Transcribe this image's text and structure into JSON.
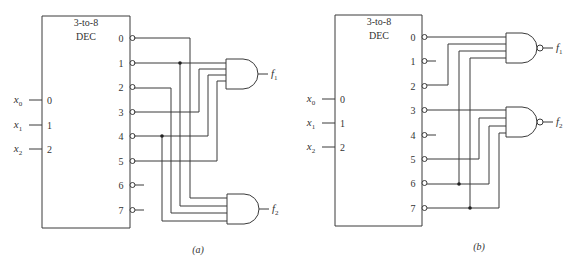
{
  "figures": [
    {
      "id": "a",
      "caption": "(a)",
      "decoder": {
        "title_line1": "3-to-8",
        "title_line2": "DEC",
        "inputs": [
          {
            "var": "x",
            "sub": "0",
            "pin": "0"
          },
          {
            "var": "x",
            "sub": "1",
            "pin": "1"
          },
          {
            "var": "x",
            "sub": "2",
            "pin": "2"
          }
        ],
        "outputs": [
          "0",
          "1",
          "2",
          "3",
          "4",
          "5",
          "6",
          "7"
        ],
        "output_polarity": "active-low"
      },
      "gates": [
        {
          "type": "AND",
          "output_var": "f",
          "output_sub": "1",
          "inputs_from_outputs": [
            1,
            3,
            4,
            5
          ]
        },
        {
          "type": "AND",
          "output_var": "f",
          "output_sub": "2",
          "inputs_from_outputs": [
            0,
            1,
            2,
            4
          ]
        }
      ],
      "junctions_on_outputs": [
        1,
        4
      ],
      "unused_outputs": [
        6,
        7
      ]
    },
    {
      "id": "b",
      "caption": "(b)",
      "decoder": {
        "title_line1": "3-to-8",
        "title_line2": "DEC",
        "inputs": [
          {
            "var": "x",
            "sub": "0",
            "pin": "0"
          },
          {
            "var": "x",
            "sub": "1",
            "pin": "1"
          },
          {
            "var": "x",
            "sub": "2",
            "pin": "2"
          }
        ],
        "outputs": [
          "0",
          "1",
          "2",
          "3",
          "4",
          "5",
          "6",
          "7"
        ],
        "output_polarity": "active-low"
      },
      "gates": [
        {
          "type": "NAND",
          "output_var": "f",
          "output_sub": "1",
          "inputs_from_outputs": [
            0,
            2,
            6,
            7
          ]
        },
        {
          "type": "NAND",
          "output_var": "f",
          "output_sub": "2",
          "inputs_from_outputs": [
            3,
            5,
            6,
            7
          ]
        }
      ],
      "junctions_on_outputs": [
        6,
        7
      ],
      "unused_outputs": [
        1,
        4
      ]
    }
  ]
}
